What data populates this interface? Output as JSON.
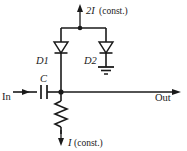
{
  "diagram": {
    "type": "electronic-circuit-schematic",
    "title": "",
    "colors": {
      "wire": "#1a1a1a",
      "background": "#ffffff",
      "fill": "#ffffff"
    },
    "labels": {
      "top_source": {
        "current": "2I",
        "qualifier": "(const.)",
        "direction": "up"
      },
      "bottom_source": {
        "current": "I",
        "qualifier": "(const.)",
        "direction": "down"
      },
      "diode1": "D1",
      "diode2": "D2",
      "capacitor": "C",
      "input": "In",
      "output": "Out"
    },
    "components": [
      {
        "name": "current-source-top",
        "label": "2I (const.)",
        "kind": "current-source"
      },
      {
        "name": "diode-d1",
        "label": "D1",
        "kind": "diode",
        "orientation": "down"
      },
      {
        "name": "diode-d2",
        "label": "D2",
        "kind": "diode",
        "orientation": "down"
      },
      {
        "name": "ground",
        "label": "",
        "kind": "ground"
      },
      {
        "name": "capacitor-c",
        "label": "C",
        "kind": "capacitor"
      },
      {
        "name": "resistor",
        "label": "",
        "kind": "resistor"
      },
      {
        "name": "current-source-bottom",
        "label": "I (const.)",
        "kind": "current-source"
      }
    ]
  }
}
